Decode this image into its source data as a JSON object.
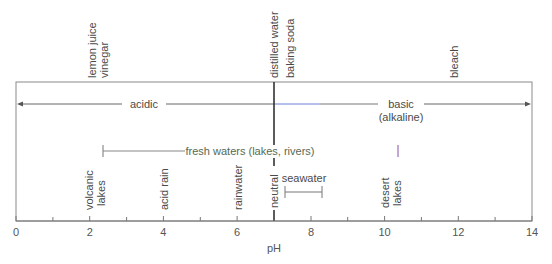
{
  "diagram": {
    "type": "ph-scale",
    "axis": {
      "label": "pH",
      "min": 0,
      "max": 14,
      "major_ticks": [
        "0",
        "2",
        "4",
        "6",
        "8",
        "10",
        "12",
        "14"
      ],
      "minor_ticks": [
        1,
        3,
        5,
        7,
        9,
        11,
        13
      ]
    },
    "top_labels": [
      {
        "lines": [
          "lemon juice",
          "vinegar"
        ],
        "ph": 2.3
      },
      {
        "lines": [
          "distilled water",
          "baking soda"
        ],
        "ph": 7.2
      },
      {
        "lines": [
          "bleach"
        ],
        "ph": 12.2
      }
    ],
    "regions": {
      "acidic": "acidic",
      "basic": "basic",
      "alkaline": "(alkaline)"
    },
    "ranges": [
      {
        "label": "fresh waters (lakes, rivers)",
        "from": 2.35,
        "to": 10.35
      },
      {
        "label": "seawater",
        "from": 7.3,
        "to": 8.3
      }
    ],
    "bottom_labels": [
      {
        "lines": [
          "volcanic",
          "lakes"
        ],
        "ph": 2.0
      },
      {
        "lines": [
          "acid rain"
        ],
        "ph": 4.0
      },
      {
        "lines": [
          "rainwater"
        ],
        "ph": 6.0
      },
      {
        "lines": [
          "neutral"
        ],
        "ph": 7.0
      },
      {
        "lines": [
          "desert",
          "lakes"
        ],
        "ph": 10.0
      }
    ],
    "colors": {
      "line": "#777777",
      "neutral_line": "#333333",
      "gradient_green": "#9be39b",
      "gradient_purple": "#9a4fb0",
      "basic_blue": "#6f7fd8"
    }
  }
}
